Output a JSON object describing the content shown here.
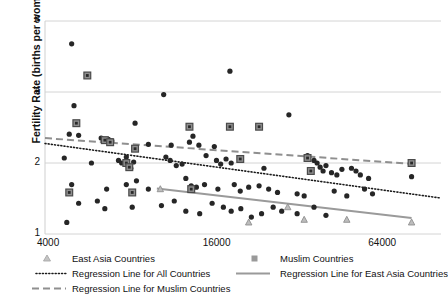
{
  "chart_data": {
    "type": "scatter",
    "title": "",
    "xlabel": "",
    "ylabel": "Fertility Rate (births per woman)",
    "x_scale": "log",
    "y_scale": "log",
    "xlim": [
      4000,
      110000
    ],
    "ylim": [
      1,
      8
    ],
    "xticks": [
      4000,
      16000,
      64000
    ],
    "xtick_labels": [
      "4000",
      "16000",
      "64000"
    ],
    "yticks": [
      1,
      2,
      4,
      8
    ],
    "ytick_labels": [
      "1",
      "2",
      "4",
      "8"
    ],
    "grid": "horizontal",
    "legend_position": "bottom",
    "legend": [
      {
        "label": "East Asia Countries",
        "marker": "triangle",
        "color": "#b0b0b0"
      },
      {
        "label": "Muslim Countries",
        "marker": "square",
        "color": "#8a8a8a"
      },
      {
        "label": "Regression Line for All Countries",
        "marker": "dotted-line",
        "color": "#1a1a1a"
      },
      {
        "label": "Regression Line for East Asia Countries",
        "marker": "solid-line",
        "color": "#9a9a9a"
      },
      {
        "label": "Regression Line for Muslim Countries",
        "marker": "dashed-line",
        "color": "#8f8f8f"
      }
    ],
    "series": [
      {
        "name": "All Countries",
        "marker": "circle",
        "color": "#262626",
        "points": [
          [
            5000,
            6.4
          ],
          [
            5700,
            4.7
          ],
          [
            5100,
            3.5
          ],
          [
            10800,
            3.9
          ],
          [
            18800,
            4.9
          ],
          [
            5200,
            2.95
          ],
          [
            8500,
            2.95
          ],
          [
            30800,
            3.2
          ],
          [
            4900,
            2.65
          ],
          [
            5300,
            2.62
          ],
          [
            6400,
            2.55
          ],
          [
            6600,
            2.5
          ],
          [
            6800,
            2.52
          ],
          [
            6900,
            2.45
          ],
          [
            7000,
            2.48
          ],
          [
            9500,
            2.4
          ],
          [
            11500,
            2.38
          ],
          [
            13400,
            2.45
          ],
          [
            13800,
            2.6
          ],
          [
            14500,
            2.38
          ],
          [
            16500,
            2.35
          ],
          [
            4700,
            2.1
          ],
          [
            5900,
            2.0
          ],
          [
            7400,
            2.05
          ],
          [
            7600,
            2.0
          ],
          [
            7900,
            2.12
          ],
          [
            8000,
            1.95
          ],
          [
            8200,
            1.9
          ],
          [
            8400,
            2.02
          ],
          [
            11000,
            2.12
          ],
          [
            11400,
            2.05
          ],
          [
            12000,
            1.95
          ],
          [
            12600,
            1.98
          ],
          [
            15400,
            2.15
          ],
          [
            16800,
            2.05
          ],
          [
            17400,
            1.98
          ],
          [
            18200,
            2.08
          ],
          [
            19000,
            2.0
          ],
          [
            25000,
            1.9
          ],
          [
            36000,
            2.15
          ],
          [
            38000,
            2.05
          ],
          [
            39000,
            2.0
          ],
          [
            40000,
            1.92
          ],
          [
            41000,
            1.85
          ],
          [
            42000,
            1.95
          ],
          [
            44000,
            1.82
          ],
          [
            46000,
            1.78
          ],
          [
            48000,
            1.88
          ],
          [
            52000,
            1.9
          ],
          [
            54000,
            1.85
          ],
          [
            56000,
            1.78
          ],
          [
            60000,
            1.72
          ],
          [
            86000,
            1.75
          ],
          [
            5000,
            1.62
          ],
          [
            6700,
            1.55
          ],
          [
            7900,
            1.62
          ],
          [
            8600,
            1.68
          ],
          [
            9500,
            1.55
          ],
          [
            13000,
            1.72
          ],
          [
            13600,
            1.6
          ],
          [
            14200,
            1.58
          ],
          [
            15200,
            1.62
          ],
          [
            17000,
            1.55
          ],
          [
            19500,
            1.62
          ],
          [
            20500,
            1.52
          ],
          [
            22000,
            1.58
          ],
          [
            24000,
            1.6
          ],
          [
            26000,
            1.55
          ],
          [
            28000,
            1.5
          ],
          [
            33000,
            1.48
          ],
          [
            35000,
            1.45
          ],
          [
            45000,
            1.52
          ],
          [
            50000,
            1.45
          ],
          [
            58000,
            1.55
          ],
          [
            62000,
            1.48
          ],
          [
            5300,
            1.35
          ],
          [
            6200,
            1.38
          ],
          [
            6600,
            1.28
          ],
          [
            8300,
            1.3
          ],
          [
            10600,
            1.32
          ],
          [
            11800,
            1.38
          ],
          [
            13000,
            1.25
          ],
          [
            14600,
            1.22
          ],
          [
            16200,
            1.35
          ],
          [
            17800,
            1.3
          ],
          [
            19000,
            1.25
          ],
          [
            20600,
            1.28
          ],
          [
            22500,
            1.18
          ],
          [
            24500,
            1.22
          ],
          [
            27000,
            1.3
          ],
          [
            29000,
            1.25
          ],
          [
            33000,
            1.22
          ],
          [
            38000,
            1.3
          ],
          [
            42000,
            1.2
          ],
          [
            4800,
            1.12
          ]
        ]
      },
      {
        "name": "Muslim Countries",
        "marker": "square",
        "color": "#2a2a2a",
        "points": [
          [
            5700,
            4.7
          ],
          [
            5200,
            2.95
          ],
          [
            13400,
            2.85
          ],
          [
            18800,
            2.85
          ],
          [
            24000,
            2.85
          ],
          [
            6600,
            2.5
          ],
          [
            6900,
            2.45
          ],
          [
            8500,
            2.3
          ],
          [
            7900,
            2.0
          ],
          [
            8100,
            1.92
          ],
          [
            20500,
            2.08
          ],
          [
            36000,
            2.1
          ],
          [
            37000,
            1.85
          ],
          [
            86000,
            2.0
          ],
          [
            4900,
            1.5
          ],
          [
            8300,
            1.5
          ],
          [
            13600,
            1.55
          ]
        ]
      },
      {
        "name": "East Asia Countries",
        "marker": "triangle",
        "color": "#a8a8a8",
        "points": [
          [
            10500,
            1.55
          ],
          [
            22000,
            1.12
          ],
          [
            30500,
            1.3
          ],
          [
            35000,
            1.15
          ],
          [
            50000,
            1.15
          ],
          [
            86000,
            1.12
          ]
        ]
      }
    ],
    "regression_lines": [
      {
        "name": "Regression Line for All Countries",
        "style": "dotted",
        "color": "#1a1a1a",
        "x_start": 4000,
        "y_start": 2.42,
        "x_end": 110000,
        "y_end": 1.42
      },
      {
        "name": "Regression Line for Muslim Countries",
        "style": "dashed",
        "color": "#8f8f8f",
        "x_start": 4000,
        "y_start": 2.55,
        "x_end": 88000,
        "y_end": 1.98
      },
      {
        "name": "Regression Line for East Asia Countries",
        "style": "solid",
        "color": "#9a9a9a",
        "x_start": 10200,
        "y_start": 1.56,
        "x_end": 86000,
        "y_end": 1.17
      }
    ]
  },
  "axes": {
    "y_title": "Fertility Rate (births per woman)"
  }
}
